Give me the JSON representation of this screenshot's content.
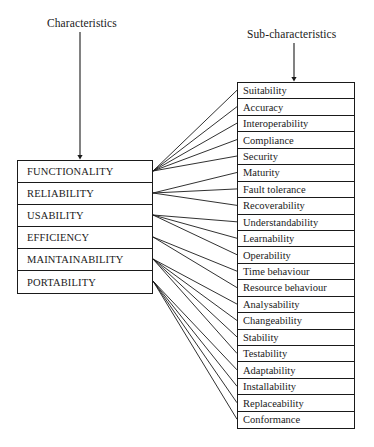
{
  "diagram": {
    "line_color": "#1a1a1a",
    "background_color": "#ffffff",
    "left_arrow_label": "Characteristics",
    "right_arrow_label": "Sub-characteristics",
    "characteristics": [
      {
        "id": "functionality",
        "label": "FUNCTIONALITY"
      },
      {
        "id": "reliability",
        "label": "RELIABILITY"
      },
      {
        "id": "usability",
        "label": "USABILITY"
      },
      {
        "id": "efficiency",
        "label": "EFFICIENCY"
      },
      {
        "id": "maintainability",
        "label": "MAINTAINABILITY"
      },
      {
        "id": "portability",
        "label": "PORTABILITY"
      }
    ],
    "subcharacteristics": [
      {
        "id": "suitability",
        "label": "Suitability",
        "parent": "functionality"
      },
      {
        "id": "accuracy",
        "label": "Accuracy",
        "parent": "functionality"
      },
      {
        "id": "interoperability",
        "label": "Interoperability",
        "parent": "functionality"
      },
      {
        "id": "compliance",
        "label": "Compliance",
        "parent": "functionality"
      },
      {
        "id": "security",
        "label": "Security",
        "parent": "functionality"
      },
      {
        "id": "maturity",
        "label": "Maturity",
        "parent": "reliability"
      },
      {
        "id": "fault-tolerance",
        "label": "Fault tolerance",
        "parent": "reliability"
      },
      {
        "id": "recoverability",
        "label": "Recoverability",
        "parent": "reliability"
      },
      {
        "id": "understandability",
        "label": "Understandability",
        "parent": "usability"
      },
      {
        "id": "learnability",
        "label": "Learnability",
        "parent": "usability"
      },
      {
        "id": "operability",
        "label": "Operability",
        "parent": "usability"
      },
      {
        "id": "time-behaviour",
        "label": "Time behaviour",
        "parent": "efficiency"
      },
      {
        "id": "resource-behaviour",
        "label": "Resource behaviour",
        "parent": "efficiency"
      },
      {
        "id": "analysability",
        "label": "Analysability",
        "parent": "maintainability"
      },
      {
        "id": "changeability",
        "label": "Changeability",
        "parent": "maintainability"
      },
      {
        "id": "stability",
        "label": "Stability",
        "parent": "maintainability"
      },
      {
        "id": "testability",
        "label": "Testability",
        "parent": "maintainability"
      },
      {
        "id": "adaptability",
        "label": "Adaptability",
        "parent": "portability"
      },
      {
        "id": "installability",
        "label": "Installability",
        "parent": "portability"
      },
      {
        "id": "replaceability",
        "label": "Replaceability",
        "parent": "portability"
      },
      {
        "id": "conformance",
        "label": "Conformance",
        "parent": "portability"
      }
    ]
  }
}
